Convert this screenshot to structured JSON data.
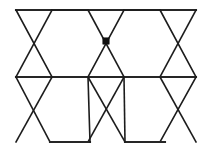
{
  "figure": {
    "type": "geometric-line-diagram",
    "canvas": {
      "width": 210,
      "height": 149
    },
    "background_color": "#ffffff",
    "line_color": "#1c1c1c",
    "heavy_line_color": "#262626",
    "marker_color": "#101010",
    "stroke_width": 1.6,
    "heavy_stroke_width": 2.1,
    "geometry": {
      "top_rail_y": 10,
      "mid_rail_y": 77,
      "bottom_base_y": 142,
      "left_x": 16,
      "right_x": 196,
      "cell_width": 36,
      "band_height": 67,
      "top_vertices_x": [
        16,
        52,
        88,
        124,
        160,
        196
      ],
      "mid_vertices_x": [
        16,
        52,
        88,
        124,
        160,
        196
      ],
      "upper_crossings": [
        {
          "x": 33,
          "y": 41
        },
        {
          "x": 106,
          "y": 41
        },
        {
          "x": 179,
          "y": 41
        }
      ],
      "lower_crossings": [
        {
          "x": 33,
          "y": 105
        },
        {
          "x": 106,
          "y": 105
        },
        {
          "x": 179,
          "y": 105
        }
      ],
      "bottom_bases": [
        {
          "x1": 50,
          "x2": 90,
          "y": 142
        },
        {
          "x1": 125,
          "x2": 165,
          "y": 142
        }
      ]
    },
    "marked_vertex": {
      "name": "center-vertex-dot",
      "x": 106,
      "y": 41,
      "radius": 3.2,
      "shape": "filled-square-dot",
      "color": "#101010"
    },
    "segments": {
      "top_rail": {
        "x1": 16,
        "y1": 10,
        "x2": 196,
        "y2": 10
      },
      "mid_rail": {
        "x1": 16,
        "y1": 77,
        "x2": 196,
        "y2": 77
      },
      "upper_band_diagonals": [
        {
          "x1": 16,
          "y1": 10,
          "x2": 52,
          "y2": 77
        },
        {
          "x1": 52,
          "y1": 10,
          "x2": 16,
          "y2": 77
        },
        {
          "x1": 88,
          "y1": 10,
          "x2": 124,
          "y2": 77
        },
        {
          "x1": 124,
          "y1": 10,
          "x2": 88,
          "y2": 77
        },
        {
          "x1": 160,
          "y1": 10,
          "x2": 196,
          "y2": 77
        },
        {
          "x1": 196,
          "y1": 10,
          "x2": 160,
          "y2": 77
        },
        {
          "x1": 52,
          "y1": 10,
          "x2": 88,
          "y2": 10
        },
        {
          "x1": 124,
          "y1": 10,
          "x2": 160,
          "y2": 10
        }
      ],
      "lower_band_diagonals": [
        {
          "x1": 16,
          "y1": 77,
          "x2": 50,
          "y2": 142
        },
        {
          "x1": 52,
          "y1": 77,
          "x2": 16,
          "y2": 142
        },
        {
          "x1": 88,
          "y1": 77,
          "x2": 125,
          "y2": 142
        },
        {
          "x1": 124,
          "y1": 77,
          "x2": 88,
          "y2": 142
        },
        {
          "x1": 160,
          "y1": 77,
          "x2": 196,
          "y2": 142
        },
        {
          "x1": 196,
          "y1": 77,
          "x2": 160,
          "y2": 142
        }
      ]
    },
    "labels": {
      "none_visible": ""
    }
  }
}
